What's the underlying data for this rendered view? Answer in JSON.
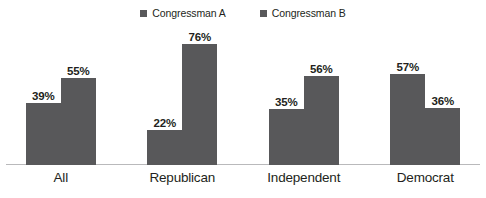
{
  "chart_data": {
    "type": "bar",
    "title": "",
    "xlabel": "",
    "ylabel": "",
    "ylim": [
      0,
      100
    ],
    "grid": false,
    "legend_position": "top-center",
    "categories": [
      "All",
      "Republican",
      "Independent",
      "Democrat"
    ],
    "series": [
      {
        "name": "Congressman A",
        "color": "#58585a",
        "values": [
          39,
          22,
          35,
          57
        ],
        "labels": [
          "39%",
          "22%",
          "35%",
          "57%"
        ]
      },
      {
        "name": "Congressman B",
        "color": "#58585a",
        "values": [
          55,
          76,
          56,
          36
        ],
        "labels": [
          "55%",
          "76%",
          "56%",
          "36%"
        ]
      }
    ]
  },
  "legend": {
    "items": [
      {
        "label": "Congressman A",
        "swatch": "legend-swatch-square"
      },
      {
        "label": "Congressman B",
        "swatch": "legend-swatch-square"
      }
    ]
  },
  "axis": {
    "categories": [
      "All",
      "Republican",
      "Independent",
      "Democrat"
    ],
    "baseline_color": "#b9b9bb"
  },
  "title_sliver": {
    "text": "·"
  },
  "colors": {
    "bar": "#58585a",
    "text": "#231f20",
    "baseline": "#b9b9bb",
    "background": "#ffffff"
  }
}
